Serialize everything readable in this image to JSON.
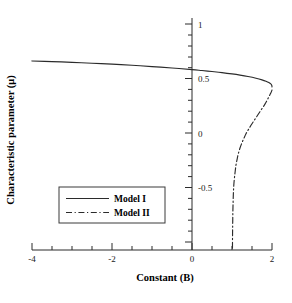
{
  "chart_data": {
    "type": "line",
    "title": "",
    "xlabel": "Constant (B)",
    "ylabel": "Characteristic parameter (μ)",
    "xlim": [
      -4,
      2
    ],
    "ylim": [
      -1.05,
      1.1
    ],
    "xticks": [
      -4,
      -2,
      0,
      2
    ],
    "xtick_labels": [
      "-4",
      "-2",
      "0",
      "2"
    ],
    "yticks": [
      1,
      0.5,
      0,
      -0.5
    ],
    "ytick_labels": [
      "1",
      "0.5",
      "0",
      "-0.5"
    ],
    "xminor_step": 0.5,
    "yminor_step": 0.1,
    "grid": false,
    "legend_position": "center-left",
    "series": [
      {
        "name": "Model I",
        "style": "solid",
        "color": "#2b2b2b",
        "points": [
          [
            -4.0,
            0.702
          ],
          [
            -3.5,
            0.696
          ],
          [
            -3.0,
            0.689
          ],
          [
            -2.5,
            0.681
          ],
          [
            -2.0,
            0.672
          ],
          [
            -1.5,
            0.662
          ],
          [
            -1.0,
            0.65
          ],
          [
            -0.5,
            0.637
          ],
          [
            0.0,
            0.622
          ],
          [
            0.25,
            0.613
          ],
          [
            0.5,
            0.604
          ],
          [
            0.75,
            0.594
          ],
          [
            1.0,
            0.582
          ],
          [
            1.2,
            0.571
          ],
          [
            1.4,
            0.558
          ],
          [
            1.6,
            0.542
          ],
          [
            1.75,
            0.527
          ],
          [
            1.85,
            0.514
          ],
          [
            1.92,
            0.502
          ],
          [
            1.97,
            0.489
          ],
          [
            1.995,
            0.475
          ],
          [
            2.0,
            0.462
          ]
        ]
      },
      {
        "name": "Model II",
        "style": "dash-dot",
        "color": "#2b2b2b",
        "points": [
          [
            2.0,
            0.432
          ],
          [
            1.97,
            0.405
          ],
          [
            1.93,
            0.375
          ],
          [
            1.88,
            0.34
          ],
          [
            1.82,
            0.3
          ],
          [
            1.74,
            0.255
          ],
          [
            1.66,
            0.21
          ],
          [
            1.58,
            0.165
          ],
          [
            1.5,
            0.12
          ],
          [
            1.42,
            0.072
          ],
          [
            1.35,
            0.028
          ],
          [
            1.3,
            -0.012
          ],
          [
            1.25,
            -0.055
          ],
          [
            1.2,
            -0.105
          ],
          [
            1.16,
            -0.155
          ],
          [
            1.13,
            -0.205
          ],
          [
            1.1,
            -0.262
          ],
          [
            1.08,
            -0.32
          ],
          [
            1.06,
            -0.385
          ],
          [
            1.045,
            -0.45
          ],
          [
            1.035,
            -0.52
          ],
          [
            1.028,
            -0.6
          ],
          [
            1.022,
            -0.69
          ],
          [
            1.018,
            -0.79
          ],
          [
            1.014,
            -0.9
          ],
          [
            1.012,
            -1.0
          ],
          [
            1.011,
            -1.05
          ]
        ]
      }
    ]
  },
  "legend": {
    "entries": [
      {
        "label": "Model I",
        "style": "solid"
      },
      {
        "label": "Model II",
        "style": "dash-dot"
      }
    ]
  }
}
